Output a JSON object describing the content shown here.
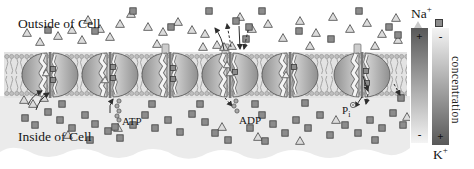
{
  "labels": {
    "outside_cell": "Outside of Cell",
    "inside_cell": "Inside of Cell",
    "atp": "ATP",
    "adp": "ADP",
    "phosphate_base": "P",
    "phosphate_sub": "i",
    "concentration": "concentration",
    "na_base": "Na",
    "na_sup": "+",
    "k_base": "K",
    "k_sup": "+"
  },
  "bars": {
    "na": {
      "top_sign": "+",
      "bottom_sign": "-",
      "gradient": "dark-top-to-light-bottom"
    },
    "k": {
      "top_sign": "-",
      "bottom_sign": "+",
      "gradient": "light-top-to-dark-bottom"
    }
  },
  "colors": {
    "bar_dark": "#585858",
    "bar_light": "#f4f4f4",
    "ion_triangle_fill": "#dcdcdc",
    "ion_stroke": "#5a5a5a",
    "ion_square_fill": "#8c8c8c",
    "ion_square_stroke": "#3c3c3c",
    "membrane": "#e3e3e3",
    "cytoplasm": "#ebebeb",
    "pump_dark": "#909090",
    "pump_light": "#d6d6d6"
  },
  "diagram": {
    "pumps": [
      {
        "x": 50,
        "cap": false,
        "squares": [
          [
            3,
            -6
          ],
          [
            3,
            5
          ]
        ],
        "triangles": [
          [
            -4,
            -2
          ]
        ]
      },
      {
        "x": 110,
        "cap": false,
        "squares": [
          [
            3,
            -8
          ],
          [
            3,
            3
          ]
        ],
        "triangles": [
          [
            -5,
            5
          ]
        ]
      },
      {
        "x": 170,
        "cap": true,
        "squares": [
          [
            3,
            -7
          ],
          [
            3,
            4
          ]
        ],
        "triangles": []
      },
      {
        "x": 230,
        "cap": true,
        "squares": [
          [
            5,
            -3
          ]
        ],
        "triangles": [
          [
            -3,
            -10
          ],
          [
            0,
            -2
          ]
        ]
      },
      {
        "x": 290,
        "cap": false,
        "squares": [
          [
            4,
            -8
          ]
        ],
        "triangles": [
          [
            -4,
            0
          ]
        ]
      },
      {
        "x": 362,
        "cap": true,
        "squares": [
          [
            4,
            -4
          ],
          [
            5,
            8
          ]
        ],
        "triangles": []
      }
    ],
    "ions": {
      "outside_triangles": [
        [
          27,
          33
        ],
        [
          40,
          42
        ],
        [
          58,
          36
        ],
        [
          72,
          30
        ],
        [
          82,
          40
        ],
        [
          88,
          20
        ],
        [
          100,
          29
        ],
        [
          110,
          37
        ],
        [
          120,
          24
        ],
        [
          131,
          14
        ],
        [
          148,
          27
        ],
        [
          157,
          44
        ],
        [
          163,
          32
        ],
        [
          178,
          22
        ],
        [
          192,
          30
        ],
        [
          203,
          47
        ],
        [
          205,
          34
        ],
        [
          217,
          45
        ],
        [
          224,
          47
        ],
        [
          232,
          46
        ],
        [
          240,
          17
        ],
        [
          252,
          29
        ],
        [
          268,
          24
        ],
        [
          283,
          38
        ],
        [
          300,
          21
        ],
        [
          310,
          46
        ],
        [
          316,
          33
        ],
        [
          333,
          17
        ],
        [
          350,
          29
        ],
        [
          367,
          23
        ],
        [
          375,
          46
        ],
        [
          382,
          34
        ],
        [
          396,
          18
        ],
        [
          398,
          40
        ]
      ],
      "outside_squares": [
        [
          48,
          30
        ],
        [
          95,
          31
        ],
        [
          133,
          11
        ],
        [
          171,
          27
        ],
        [
          209,
          11
        ],
        [
          236,
          21
        ],
        [
          246,
          39
        ],
        [
          249,
          27
        ],
        [
          262,
          11
        ],
        [
          299,
          31
        ],
        [
          331,
          39
        ],
        [
          359,
          11
        ],
        [
          389,
          27
        ],
        [
          398,
          35
        ]
      ],
      "inside_squares": [
        [
          25,
          118
        ],
        [
          35,
          125
        ],
        [
          48,
          112
        ],
        [
          60,
          120
        ],
        [
          62,
          104
        ],
        [
          72,
          128
        ],
        [
          85,
          115
        ],
        [
          90,
          140
        ],
        [
          95,
          124
        ],
        [
          108,
          131
        ],
        [
          115,
          127
        ],
        [
          120,
          138
        ],
        [
          133,
          125
        ],
        [
          145,
          115
        ],
        [
          152,
          104
        ],
        [
          155,
          128
        ],
        [
          168,
          120
        ],
        [
          180,
          132
        ],
        [
          192,
          114
        ],
        [
          200,
          104
        ],
        [
          205,
          122
        ],
        [
          215,
          133
        ],
        [
          228,
          140
        ],
        [
          250,
          128
        ],
        [
          255,
          104
        ],
        [
          262,
          115
        ],
        [
          265,
          141
        ],
        [
          273,
          124
        ],
        [
          285,
          133
        ],
        [
          296,
          120
        ],
        [
          305,
          103
        ],
        [
          308,
          128
        ],
        [
          320,
          115
        ],
        [
          330,
          135
        ],
        [
          345,
          125
        ],
        [
          358,
          133
        ],
        [
          370,
          120
        ],
        [
          375,
          140
        ],
        [
          382,
          128
        ],
        [
          393,
          113
        ],
        [
          401,
          98
        ],
        [
          403,
          125
        ]
      ],
      "inside_triangles": [
        [
          24,
          100
        ],
        [
          33,
          104
        ],
        [
          44,
          98
        ],
        [
          68,
          135
        ],
        [
          118,
          128
        ],
        [
          222,
          127
        ],
        [
          258,
          137
        ],
        [
          300,
          141
        ],
        [
          336,
          120
        ],
        [
          407,
          117
        ]
      ]
    },
    "arrows": [
      {
        "f": [
          28,
          105
        ],
        "t": [
          42,
          91
        ],
        "c": -4
      },
      {
        "f": [
          36,
          110
        ],
        "t": [
          49,
          93
        ],
        "c": -4
      },
      {
        "f": [
          110,
          113
        ],
        "t": [
          113,
          99
        ],
        "c": -3
      },
      {
        "f": [
          225,
          98
        ],
        "t": [
          232,
          106
        ],
        "c": 0,
        "dash": true
      },
      {
        "f": [
          224,
          50
        ],
        "t": [
          215,
          28
        ],
        "c": 3
      },
      {
        "f": [
          231,
          47
        ],
        "t": [
          227,
          24
        ],
        "c": 0,
        "dash": true
      },
      {
        "f": [
          239,
          26
        ],
        "t": [
          240,
          49
        ],
        "c": 0
      },
      {
        "f": [
          248,
          30
        ],
        "t": [
          244,
          49
        ],
        "c": 0,
        "dash": true
      },
      {
        "f": [
          363,
          76
        ],
        "t": [
          368,
          91
        ],
        "c": 0
      },
      {
        "f": [
          362,
          97
        ],
        "t": [
          355,
          107
        ],
        "c": 0
      },
      {
        "f": [
          368,
          94
        ],
        "t": [
          366,
          104
        ],
        "c": 0,
        "dash": true
      },
      {
        "f": [
          394,
          84
        ],
        "t": [
          400,
          95
        ],
        "c": 0,
        "dash": true
      }
    ],
    "molecules": {
      "atp_beads": [
        [
          119,
          101
        ],
        [
          117,
          106
        ],
        [
          119,
          111
        ],
        [
          117,
          116
        ],
        [
          119,
          120
        ]
      ],
      "adp_beads": [
        [
          236,
          101
        ],
        [
          234,
          106
        ],
        [
          237,
          111
        ]
      ],
      "pi_circle": [
        353,
        105
      ]
    }
  }
}
